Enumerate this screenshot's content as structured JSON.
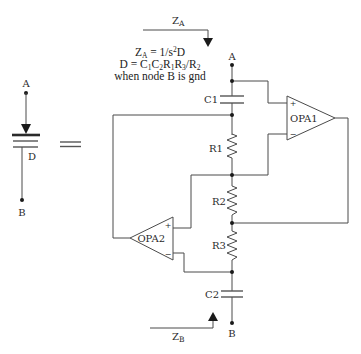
{
  "left_symbol": {
    "node_a_label": "A",
    "node_b_label": "B",
    "device_label": "D"
  },
  "equivalence_sign": "=",
  "impedance_a": {
    "main": "Z",
    "sub": "A"
  },
  "impedance_b": {
    "main": "Z",
    "sub": "B"
  },
  "formula": {
    "line1": [
      {
        "text": "Z"
      },
      {
        "text": "A"
      },
      {
        "text": " = 1/s"
      },
      {
        "text": "2"
      },
      {
        "text": "D"
      }
    ],
    "line2": [
      {
        "text": "D = C"
      },
      {
        "text": "1"
      },
      {
        "text": "C"
      },
      {
        "text": "2"
      },
      {
        "text": "R"
      },
      {
        "text": "1"
      },
      {
        "text": "R"
      },
      {
        "text": "3"
      },
      {
        "text": "/R"
      },
      {
        "text": "2"
      }
    ],
    "line3": "when node B is gnd"
  },
  "circuit": {
    "node_a_label": "A",
    "node_b_label": "B",
    "capacitors": [
      {
        "label": "C1"
      },
      {
        "label": "C2"
      }
    ],
    "resistors": [
      {
        "label": "R1"
      },
      {
        "label": "R2"
      },
      {
        "label": "R3"
      }
    ],
    "opamps": [
      {
        "label": "OPA1",
        "plus": "+",
        "minus": "−"
      },
      {
        "label": "OPA2",
        "plus": "+",
        "minus": "−"
      }
    ]
  },
  "colors": {
    "wire": "#4a4a4a",
    "node": "#1a1a1a",
    "background": "#ffffff"
  }
}
